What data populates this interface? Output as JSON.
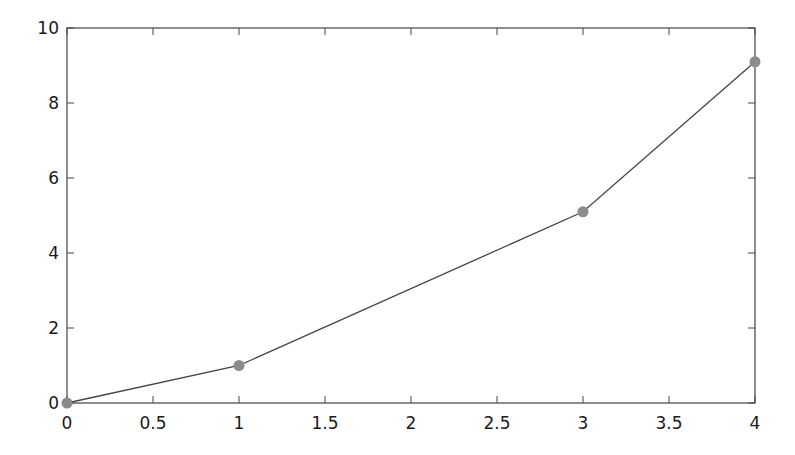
{
  "chart_data": {
    "type": "line",
    "title": "",
    "xlabel": "",
    "ylabel": "",
    "xlim": [
      0,
      4
    ],
    "ylim": [
      0,
      10
    ],
    "grid": false,
    "legend": null,
    "x_ticks": [
      "0",
      "0.5",
      "1",
      "1.5",
      "2",
      "2.5",
      "3",
      "3.5",
      "4"
    ],
    "y_ticks": [
      "0",
      "2",
      "4",
      "6",
      "8",
      "10"
    ],
    "series": [
      {
        "name": "series-1",
        "x": [
          0,
          1,
          3,
          4
        ],
        "y": [
          0,
          1.0,
          5.1,
          9.1
        ],
        "line_color": "#444444",
        "marker_color": "#8c8c8c",
        "marker": "circle"
      }
    ]
  },
  "colors": {
    "axes": "#444444",
    "line": "#444444",
    "marker": "#8c8c8c",
    "text": "#1a1a1a",
    "background": "#ffffff"
  }
}
